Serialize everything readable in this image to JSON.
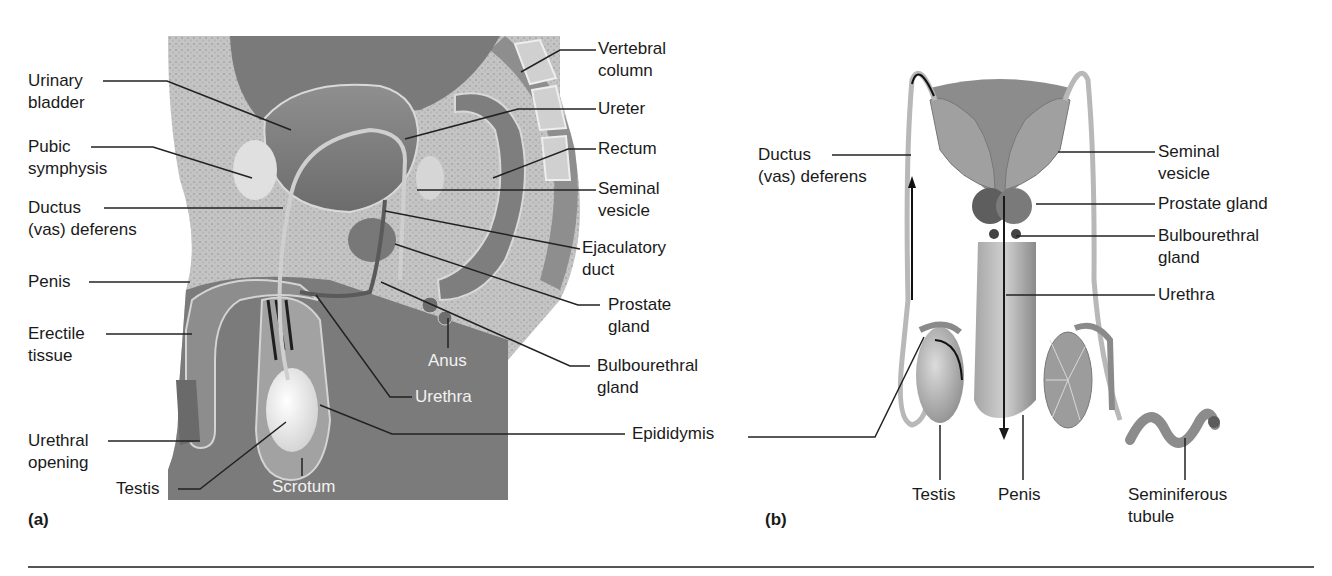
{
  "figure": {
    "panel_a": {
      "tag": "(a)",
      "view": "sagittal-section",
      "labels": {
        "urinary_bladder": [
          "Urinary",
          "bladder"
        ],
        "pubic_symphysis": [
          "Pubic",
          "symphysis"
        ],
        "ductus_deferens": [
          "Ductus",
          "(vas) deferens"
        ],
        "penis": "Penis",
        "erectile_tissue": [
          "Erectile",
          "tissue"
        ],
        "urethral_opening": [
          "Urethral",
          "opening"
        ],
        "testis": "Testis",
        "scrotum": "Scrotum",
        "anus": "Anus",
        "urethra": "Urethra",
        "vertebral_column": [
          "Vertebral",
          "column"
        ],
        "ureter": "Ureter",
        "rectum": "Rectum",
        "seminal_vesicle": [
          "Seminal",
          "vesicle"
        ],
        "ejaculatory_duct": [
          "Ejaculatory",
          "duct"
        ],
        "prostate_gland": [
          "Prostate",
          "gland"
        ],
        "bulbourethral_gland": [
          "Bulbourethral",
          "gland"
        ],
        "epididymis": "Epididymis"
      }
    },
    "panel_b": {
      "tag": "(b)",
      "view": "posterior-view",
      "labels": {
        "ductus_deferens": [
          "Ductus",
          "(vas) deferens"
        ],
        "seminal_vesicle": [
          "Seminal",
          "vesicle"
        ],
        "prostate_gland": "Prostate gland",
        "bulbourethral_gland": [
          "Bulbourethral",
          "gland"
        ],
        "urethra": "Urethra",
        "testis": "Testis",
        "penis": "Penis",
        "seminiferous_tubule": [
          "Seminiferous",
          "tubule"
        ]
      }
    },
    "colors": {
      "tissue_dark": "#6e6e6e",
      "tissue_mid": "#9a9a9a",
      "tissue_light": "#c8c8c8",
      "bone_texture": "#b5b5b5",
      "leader_line": "#222222",
      "rule": "#555555"
    }
  }
}
